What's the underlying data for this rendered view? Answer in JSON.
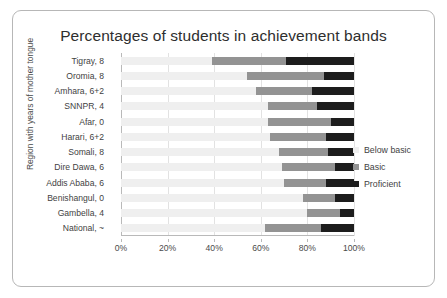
{
  "chart_data": {
    "type": "bar",
    "subtype": "horizontal-stacked-100",
    "title": "Percentages of students in achievement bands",
    "xlabel": "",
    "ylabel": "Region with years of mother tongue",
    "xlim": [
      0,
      100
    ],
    "x_tick_labels": [
      "0%",
      "20%",
      "40%",
      "60%",
      "80%",
      "100%"
    ],
    "x_tick_values": [
      0,
      20,
      40,
      60,
      80,
      100
    ],
    "grid": true,
    "legend_position": "right",
    "categories": [
      "Tigray, 8",
      "Oromia, 8",
      "Amhara, 6+2",
      "SNNPR, 4",
      "Afar, 0",
      "Harari, 6+2",
      "Somali, 8",
      "Dire Dawa, 6",
      "Addis Ababa, 6",
      "Benishangul, 0",
      "Gambella, 4",
      "National, ~"
    ],
    "series": [
      {
        "name": "Below basic",
        "color": "#efefef",
        "values": [
          39,
          54,
          58,
          63,
          63,
          64,
          68,
          69,
          70,
          78,
          80,
          62
        ]
      },
      {
        "name": "Basic",
        "color": "#939393",
        "values": [
          32,
          33,
          24,
          21,
          27,
          24,
          21,
          23,
          18,
          14,
          14,
          24
        ]
      },
      {
        "name": "Proficient",
        "color": "#1d1d1d",
        "values": [
          29,
          13,
          18,
          16,
          10,
          12,
          11,
          8,
          12,
          8,
          6,
          14
        ]
      }
    ]
  },
  "legend": {
    "items": [
      {
        "label": "Below basic",
        "color": "#efefef"
      },
      {
        "label": "Basic",
        "color": "#939393"
      },
      {
        "label": "Proficient",
        "color": "#1d1d1d"
      }
    ]
  },
  "colors": {
    "card_border": "#b7b7b7",
    "axis": "#b9b9b9",
    "gridline": "#e2e2e2",
    "text": "#3f3f3f"
  }
}
